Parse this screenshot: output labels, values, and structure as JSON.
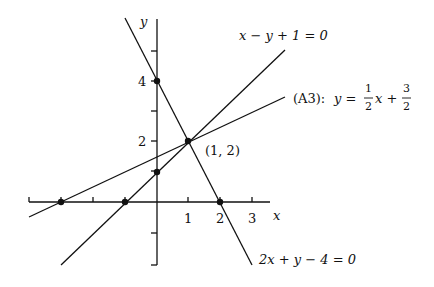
{
  "diagram": {
    "type": "line-graph",
    "axes": {
      "x_label": "x",
      "y_label": "y",
      "x_ticks": [
        "1",
        "2",
        "3"
      ],
      "y_ticks": [
        "2",
        "4"
      ],
      "xlim": [
        -4,
        3.7
      ],
      "ylim": [
        -2,
        6
      ]
    },
    "lines": [
      {
        "name": "line-2x-y-4",
        "equation": "2x + y − 4 = 0",
        "label": "2x + y − 4 = 0"
      },
      {
        "name": "line-x-y-1",
        "equation": "x − y + 1 = 0",
        "label": "x − y + 1 = 0"
      },
      {
        "name": "line-a3",
        "equation": "y = 1/2 x + 3/2",
        "label_prefix": "(A3):",
        "label_lhs": "y =",
        "frac1_num": "1",
        "frac1_den": "2",
        "frac_var": "x +",
        "frac2_num": "3",
        "frac2_den": "2"
      }
    ],
    "points": [
      {
        "x": 0,
        "y": 4
      },
      {
        "x": 1,
        "y": 2,
        "label": "(1, 2)"
      },
      {
        "x": 0,
        "y": 1
      },
      {
        "x": -1,
        "y": 0
      },
      {
        "x": -3,
        "y": 0
      },
      {
        "x": 2,
        "y": 0
      }
    ],
    "intersection_label": "(1, 2)"
  }
}
